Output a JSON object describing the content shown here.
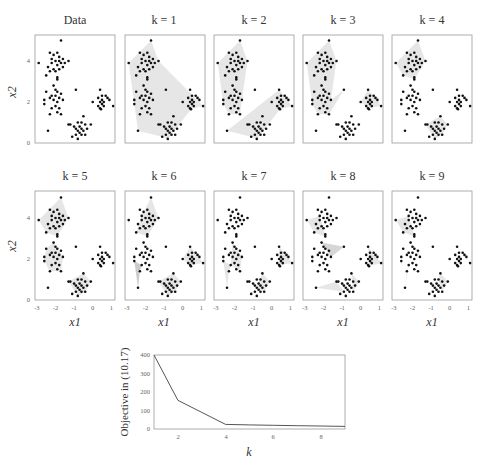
{
  "figure": {
    "panel_titles": [
      "Data",
      "k = 1",
      "k = 2",
      "k = 3",
      "k = 4",
      "k = 5",
      "k = 6",
      "k = 7",
      "k = 8",
      "k = 9"
    ],
    "scatter_axes": {
      "xlabel": "x1",
      "ylabel": "x2",
      "xticks": [
        "-3",
        "-2",
        "-1",
        "0",
        "1"
      ],
      "yticks": [
        "0",
        "2",
        "4"
      ]
    },
    "objective_axes": {
      "xlabel": "k",
      "ylabel": "Objective in (10.17)",
      "xticks": [
        "2",
        "4",
        "6",
        "8"
      ],
      "yticks": [
        "0",
        "100",
        "200",
        "300",
        "400"
      ]
    }
  },
  "chart_data": [
    {
      "type": "scatter",
      "title": "Data and k-means cluster hulls for k = 1..9",
      "xlabel": "x1",
      "ylabel": "x2",
      "xlim": [
        -3,
        1.2
      ],
      "ylim": [
        0,
        5.2
      ],
      "panels": [
        "Data",
        "k = 1",
        "k = 2",
        "k = 3",
        "k = 4",
        "k = 5",
        "k = 6",
        "k = 7",
        "k = 8",
        "k = 9"
      ],
      "clusters": [
        {
          "name": "top-left",
          "center": [
            -1.9,
            3.9
          ]
        },
        {
          "name": "middle-left",
          "center": [
            -2.0,
            2.2
          ]
        },
        {
          "name": "right",
          "center": [
            0.5,
            2.0
          ]
        },
        {
          "name": "bottom",
          "center": [
            -0.7,
            0.7
          ]
        }
      ],
      "grid": false
    },
    {
      "type": "line",
      "title": "",
      "xlabel": "k",
      "ylabel": "Objective in (10.17)",
      "x": [
        1,
        2,
        3,
        4,
        5,
        6,
        7,
        8,
        9
      ],
      "values": [
        400,
        155,
        90,
        25,
        22,
        20,
        18,
        16,
        14
      ],
      "xlim": [
        1,
        9
      ],
      "ylim": [
        0,
        400
      ],
      "xticks": [
        2,
        4,
        6,
        8
      ],
      "yticks": [
        0,
        100,
        200,
        300,
        400
      ],
      "grid": false
    }
  ]
}
